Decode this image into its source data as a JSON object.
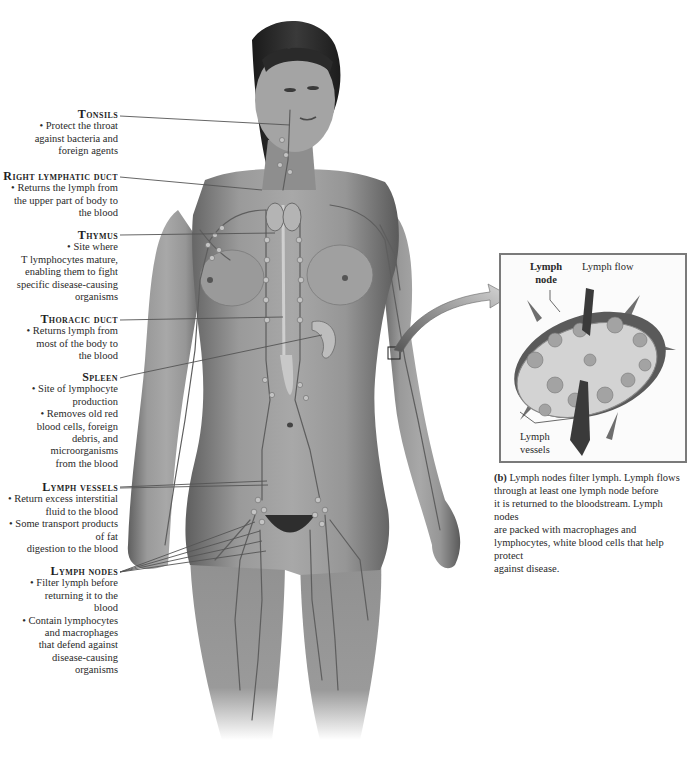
{
  "figure": {
    "panel_a_labels": [
      {
        "id": "tonsils",
        "title": "Tonsils",
        "lines": [
          "• Protect the throat",
          "against bacteria and",
          "foreign agents"
        ]
      },
      {
        "id": "right-lymphatic-duct",
        "title": "Right lymphatic duct",
        "lines": [
          "• Returns the lymph from",
          "the upper part of body to",
          "the blood"
        ]
      },
      {
        "id": "thymus",
        "title": "Thymus",
        "lines": [
          "• Site where",
          "T lymphocytes mature,",
          "enabling them to fight",
          "specific disease-causing",
          "organisms"
        ]
      },
      {
        "id": "thoracic-duct",
        "title": "Thoracic duct",
        "lines": [
          "• Returns lymph from",
          "most of the body to",
          "the blood"
        ]
      },
      {
        "id": "spleen",
        "title": "Spleen",
        "lines": [
          "• Site of lymphocyte",
          "production",
          "• Removes old red",
          "blood cells, foreign",
          "debris, and",
          "microorganisms",
          "from the blood"
        ]
      },
      {
        "id": "lymph-vessels",
        "title": "Lymph vessels",
        "lines": [
          "• Return excess interstitial",
          "fluid to the blood",
          "• Some transport products",
          "of fat",
          "digestion to the blood"
        ]
      },
      {
        "id": "lymph-nodes",
        "title": "Lymph nodes",
        "lines": [
          "• Filter lymph before",
          "returning it to the",
          "blood",
          "• Contain lymphocytes",
          "and macrophages",
          "that defend against",
          "disease-causing",
          "organisms"
        ]
      }
    ],
    "panel_b": {
      "node_label_line1": "Lymph",
      "node_label_line2": "node",
      "flow_label": "Lymph flow",
      "vessels_label_line1": "Lymph",
      "vessels_label_line2": "vessels",
      "caption_letter": "(b)",
      "caption_lines": [
        "Lymph nodes filter lymph. Lymph flows",
        "through at least one lymph node before",
        "it is returned to the bloodstream. Lymph  nodes",
        "are packed with macrophages and",
        "lymphocytes, white blood cells that help protect",
        "against disease."
      ]
    },
    "colors": {
      "skin": "#8c8c8c",
      "lymph_vessel": "#5e5e5e",
      "node": "#b9b9b9",
      "leader_line": "#555555",
      "inset_border": "#7a7a7a"
    }
  }
}
